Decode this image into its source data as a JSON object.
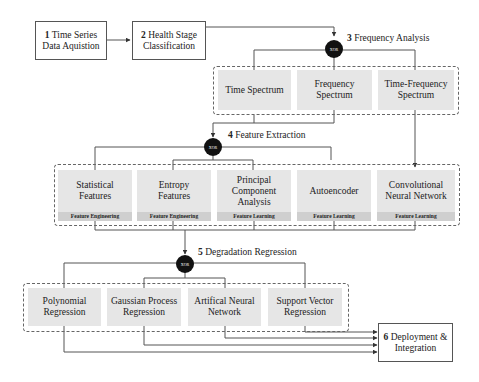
{
  "diagram": {
    "type": "pipeline-flowchart",
    "gate_label": "XOR",
    "steps": [
      {
        "num": "1",
        "title_line1": "Time Series",
        "title_line2": "Data Aquistion"
      },
      {
        "num": "2",
        "title_line1": "Health Stage",
        "title_line2": "Classification"
      },
      {
        "num": "3",
        "title": "Frequency Analysis"
      },
      {
        "num": "4",
        "title": "Feature Extraction"
      },
      {
        "num": "5",
        "title": "Degradation Regression"
      },
      {
        "num": "6",
        "title_line1": "Deployment &",
        "title_line2": "Integration"
      }
    ],
    "frequency_analysis": {
      "options": [
        {
          "line1": "Time Spectrum",
          "line2": ""
        },
        {
          "line1": "Frequency",
          "line2": "Spectrum"
        },
        {
          "line1": "Time-Frequency",
          "line2": "Spectrum"
        }
      ]
    },
    "feature_extraction": {
      "options": [
        {
          "line1": "Statistical",
          "line2": "Features",
          "line3": "",
          "tag": "Feature Engineering"
        },
        {
          "line1": "Entropy",
          "line2": "Features",
          "line3": "",
          "tag": "Feature Engineering"
        },
        {
          "line1": "Principal",
          "line2": "Component",
          "line3": "Analysis",
          "tag": "Feature Learning"
        },
        {
          "line1": "Autoencoder",
          "line2": "",
          "line3": "",
          "tag": "Feature Learning"
        },
        {
          "line1": "Convolutional",
          "line2": "Neural Network",
          "line3": "",
          "tag": "Feature Learning"
        }
      ]
    },
    "degradation_regression": {
      "options": [
        {
          "line1": "Polynomial",
          "line2": "Regression"
        },
        {
          "line1": "Gaussian Process",
          "line2": "Regression"
        },
        {
          "line1": "Artifical Neural",
          "line2": "Network"
        },
        {
          "line1": "Support Vector",
          "line2": "Regression"
        }
      ]
    },
    "colors": {
      "line": "#444444",
      "option_fill": "#e6e6e6",
      "tag_fill": "#cfcfcf",
      "gate_fill": "#111111"
    }
  }
}
